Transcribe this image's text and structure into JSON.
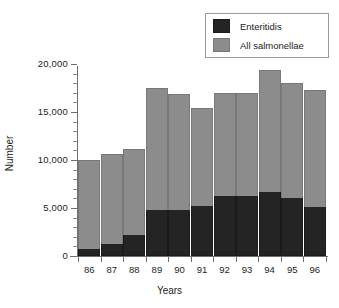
{
  "chart_data": {
    "type": "bar",
    "subtype": "stacked-vertical",
    "title": "",
    "xlabel": "Years",
    "ylabel": "Number",
    "categories": [
      "86",
      "87",
      "88",
      "89",
      "90",
      "91",
      "92",
      "93",
      "94",
      "95",
      "96"
    ],
    "series": [
      {
        "name": "Enteritidis",
        "color": "#242424",
        "values": [
          700,
          1200,
          2200,
          4800,
          4800,
          5200,
          6200,
          6200,
          6700,
          6000,
          5100
        ]
      },
      {
        "name": "All salmonellae",
        "color": "#8c8c8c",
        "note": "series plotted as stack total (top of bar)",
        "values": [
          10000,
          10600,
          11200,
          17500,
          16900,
          15400,
          17000,
          17000,
          19400,
          18000,
          17300
        ]
      }
    ],
    "ylim": [
      0,
      20000
    ],
    "yticks": [
      0,
      5000,
      10000,
      15000,
      20000
    ],
    "ytick_labels": [
      "0",
      "5,000",
      "10,000",
      "15,000",
      "20,000"
    ],
    "yminor_step": 1000,
    "grid": false,
    "legend_position": "top-right",
    "legend_entries": [
      "Enteritidis",
      "All salmonellae"
    ]
  },
  "legend": {
    "items": [
      {
        "label": "Enteritidis"
      },
      {
        "label": "All salmonellae"
      }
    ]
  },
  "axes": {
    "x_title": "Years",
    "y_title": "Number"
  }
}
